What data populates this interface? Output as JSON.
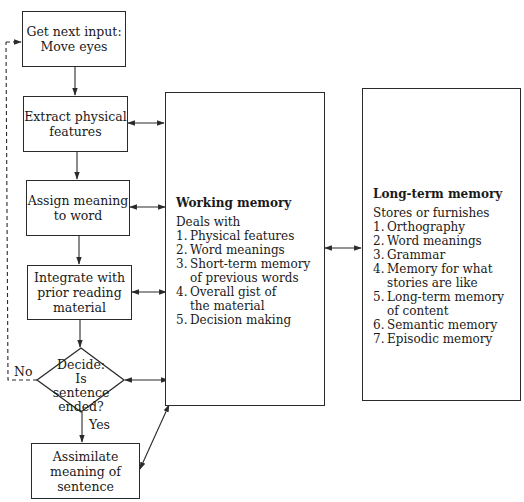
{
  "flow": {
    "steps": [
      {
        "id": "get-next-input",
        "label": "Get next input:\nMove eyes"
      },
      {
        "id": "extract-features",
        "label": "Extract physical\nfeatures"
      },
      {
        "id": "assign-meaning",
        "label": "Assign meaning\nto word"
      },
      {
        "id": "integrate",
        "label": "Integrate with\nprior reading\nmaterial"
      },
      {
        "id": "assimilate",
        "label": "Assimilate\nmeaning of\nsentence"
      }
    ],
    "decision": {
      "label": "Decide:\nIs sentence\nended?",
      "no_label": "No",
      "yes_label": "Yes"
    }
  },
  "working_memory": {
    "title": "Working memory",
    "lead": "Deals with",
    "items": [
      {
        "num": "1.",
        "text": "Physical features"
      },
      {
        "num": "2.",
        "text": "Word meanings"
      },
      {
        "num": "3.",
        "text": "Short-term memory\nof previous words"
      },
      {
        "num": "4.",
        "text": "Overall gist of\nthe material"
      },
      {
        "num": "5.",
        "text": "Decision making"
      }
    ]
  },
  "long_term_memory": {
    "title": "Long-term memory",
    "lead": "Stores or furnishes",
    "items": [
      {
        "num": "1.",
        "text": "Orthography"
      },
      {
        "num": "2.",
        "text": "Word meanings"
      },
      {
        "num": "3.",
        "text": "Grammar"
      },
      {
        "num": "4.",
        "text": "Memory for what\nstories are like"
      },
      {
        "num": "5.",
        "text": "Long-term memory\nof content"
      },
      {
        "num": "6.",
        "text": "Semantic memory"
      },
      {
        "num": "7.",
        "text": "Episodic memory"
      }
    ]
  },
  "colors": {
    "line": "#2a2a2a",
    "background": "#ffffff"
  }
}
